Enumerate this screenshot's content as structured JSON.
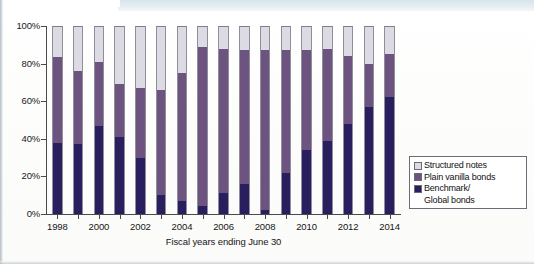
{
  "chart_data": {
    "type": "bar",
    "stacked": true,
    "normalized_percent": true,
    "title": "",
    "xlabel": "Fiscal years ending June 30",
    "ylabel": "",
    "ylim": [
      0,
      100
    ],
    "ytick_labels": [
      "0%",
      "20%",
      "40%",
      "60%",
      "80%",
      "100%"
    ],
    "ytick_values": [
      0,
      20,
      40,
      60,
      80,
      100
    ],
    "grid": false,
    "legend_position": "right",
    "categories": [
      "1998",
      "1999",
      "2000",
      "2001",
      "2002",
      "2003",
      "2004",
      "2005",
      "2006",
      "2007",
      "2008",
      "2009",
      "2010",
      "2011",
      "2012",
      "2013",
      "2014"
    ],
    "xtick_labels_shown": [
      "1998",
      "2000",
      "2002",
      "2004",
      "2006",
      "2008",
      "2010",
      "2012",
      "2014"
    ],
    "series": [
      {
        "name": "Benchmark/ Global bonds",
        "color": "#2a1f5e",
        "values": [
          38,
          37,
          47,
          41,
          30,
          10,
          7,
          4,
          11,
          16,
          2,
          22,
          34,
          39,
          48,
          57,
          62
        ]
      },
      {
        "name": "Plain vanilla bonds",
        "color": "#6c5380",
        "values": [
          45.5,
          39,
          34,
          28,
          37,
          56,
          68,
          85,
          77,
          71,
          85,
          65,
          53,
          49,
          36,
          23,
          23
        ]
      },
      {
        "name": "Structured notes",
        "color": "#dcdbe4",
        "values": [
          16.5,
          24,
          19,
          31,
          33,
          34,
          25,
          11,
          12,
          13,
          13,
          13,
          13,
          12,
          16,
          20,
          15
        ]
      }
    ]
  },
  "legend": {
    "entries": [
      {
        "label": "Structured notes",
        "sublabel": "",
        "color": "#dcdbe4"
      },
      {
        "label": "Plain vanilla bonds",
        "sublabel": "",
        "color": "#6c5380"
      },
      {
        "label": "Benchmark/",
        "sublabel": "Global bonds",
        "color": "#2a1f5e"
      }
    ]
  }
}
